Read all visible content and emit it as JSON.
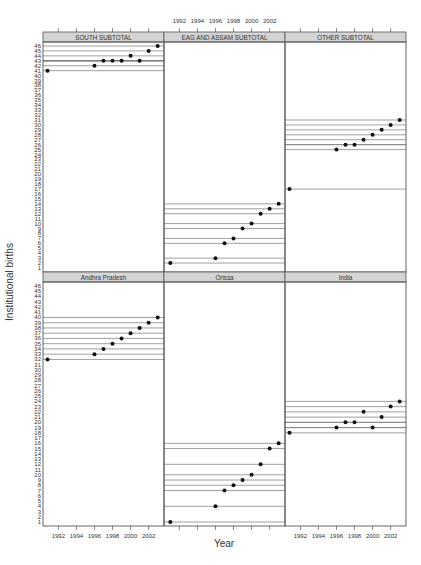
{
  "chart_data": {
    "type": "scatter",
    "title": "",
    "xlabel": "Year",
    "ylabel": "Institutional births",
    "xlim": [
      1990.3,
      2003.7
    ],
    "ylim": [
      1,
      46
    ],
    "x_ticks": [
      1992,
      1994,
      1996,
      1998,
      2000,
      2002
    ],
    "y_ticks": [
      1,
      2,
      3,
      4,
      5,
      6,
      7,
      8,
      9,
      10,
      11,
      12,
      13,
      14,
      15,
      16,
      17,
      18,
      19,
      20,
      21,
      22,
      23,
      24,
      25,
      26,
      27,
      28,
      29,
      30,
      31,
      32,
      33,
      34,
      35,
      36,
      37,
      38,
      39,
      40,
      41,
      42,
      43,
      44,
      45,
      46
    ],
    "layout": {
      "rows": 2,
      "cols": 3
    },
    "panels": [
      {
        "name": "SOUTH SUBTOTAL",
        "row": 0,
        "col": 0,
        "x": [
          1990.8,
          1996,
          1997,
          1998,
          1999,
          2000,
          2001,
          2002,
          2003
        ],
        "y": [
          41,
          42,
          43,
          43,
          43,
          44,
          43,
          45,
          46
        ]
      },
      {
        "name": "EAG AND ASSAM SUBTOTAL",
        "row": 0,
        "col": 1,
        "x": [
          1991,
          1996,
          1997,
          1998,
          1999,
          2000,
          2001,
          2002,
          2003
        ],
        "y": [
          2,
          3,
          6,
          7,
          9,
          10,
          12,
          13,
          14
        ]
      },
      {
        "name": "OTHER SUBTOTAL",
        "row": 0,
        "col": 2,
        "x": [
          1990.8,
          1996,
          1997,
          1998,
          1999,
          2000,
          2001,
          2002,
          2003
        ],
        "y": [
          17,
          25,
          26,
          26,
          27,
          28,
          29,
          30,
          31
        ]
      },
      {
        "name": "Andhra Pradesh",
        "row": 1,
        "col": 0,
        "x": [
          1990.8,
          1996,
          1997,
          1998,
          1999,
          2000,
          2001,
          2002,
          2003
        ],
        "y": [
          32,
          33,
          34,
          35,
          36,
          37,
          38,
          39,
          40
        ]
      },
      {
        "name": "Orissa",
        "row": 1,
        "col": 1,
        "x": [
          1991,
          1996,
          1997,
          1998,
          1999,
          2000,
          2001,
          2002,
          2003
        ],
        "y": [
          1,
          4,
          7,
          8,
          9,
          10,
          12,
          15,
          16
        ]
      },
      {
        "name": "India",
        "row": 1,
        "col": 2,
        "x": [
          1990.8,
          1996,
          1997,
          1998,
          1999,
          2000,
          2001,
          2002,
          2003
        ],
        "y": [
          18,
          19,
          20,
          20,
          22,
          19,
          21,
          23,
          24
        ]
      }
    ],
    "grid": false,
    "legend": null
  }
}
